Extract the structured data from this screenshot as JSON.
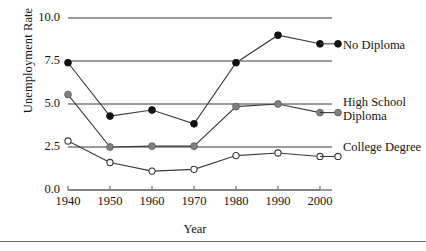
{
  "chart_data": {
    "type": "line",
    "title": "",
    "xlabel": "Year",
    "ylabel": "Unemployment Rate",
    "categories": [
      1940,
      1950,
      1960,
      1970,
      1980,
      1990,
      2000
    ],
    "x_tick_labels": [
      "1940",
      "1950",
      "1960",
      "1970",
      "1980",
      "1990",
      "2000"
    ],
    "y_tick_labels": [
      "0.0",
      "2.5",
      "5.0",
      "7.5",
      "10.0"
    ],
    "y_ticks": [
      0.0,
      2.5,
      5.0,
      7.5,
      10.0
    ],
    "ylim": [
      0.0,
      10.0
    ],
    "xlim": [
      1940,
      2000
    ],
    "grid": "horizontal",
    "legend_position": "right-of-line-ends",
    "series": [
      {
        "name": "No Diploma",
        "label": "No Diploma",
        "marker": "filled-circle",
        "color": "#111111",
        "values": [
          7.4,
          4.3,
          4.65,
          3.85,
          7.4,
          9.0,
          8.5
        ]
      },
      {
        "name": "High School Diploma",
        "label": "High School\nDiploma",
        "marker": "gray-filled-circle",
        "color": "#808080",
        "values": [
          5.55,
          2.5,
          2.55,
          2.55,
          4.85,
          5.0,
          4.5
        ]
      },
      {
        "name": "College Degree",
        "label": "College Degree",
        "marker": "open-circle",
        "color": "#ffffff",
        "values": [
          2.85,
          1.6,
          1.1,
          1.2,
          2.0,
          2.15,
          1.95
        ]
      }
    ],
    "gridline_color": "#7a7a7a",
    "line_color": "#3a3a3a",
    "axis_color": "#7a7a7a"
  }
}
